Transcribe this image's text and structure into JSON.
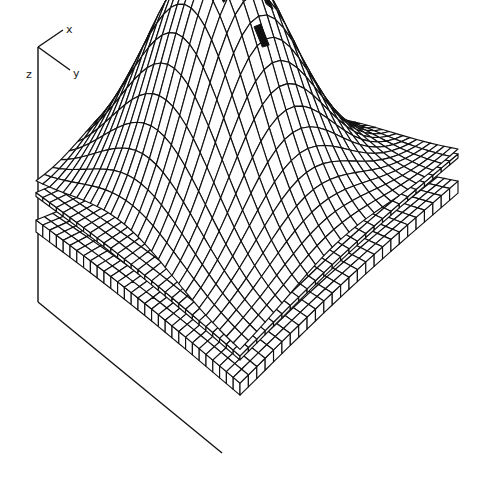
{
  "figure": {
    "type": "3d-wireframe-surface",
    "axes": {
      "labels": {
        "x": "x",
        "y": "y",
        "z": "z"
      }
    },
    "layers": [
      {
        "name": "top-surface",
        "shape": "dome",
        "grid_u": 26,
        "grid_v": 30,
        "relative_peak_height": 1.0
      },
      {
        "name": "middle-layer",
        "shape": "gentle-arch",
        "grid_u": 26,
        "grid_v": 30,
        "relative_peak_height": 0.25
      },
      {
        "name": "bottom-layer",
        "shape": "gentle-arch",
        "grid_u": 26,
        "grid_v": 30,
        "relative_peak_height": 0.2
      }
    ],
    "highlighted_cells": 4,
    "colors": {
      "line": "#111111",
      "background": "#ffffff",
      "highlight": "#111111"
    }
  }
}
